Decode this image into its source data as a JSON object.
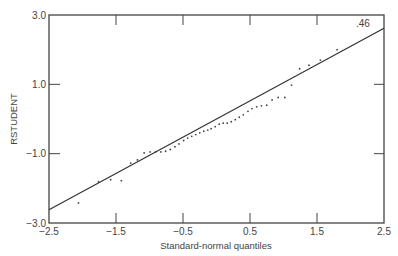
{
  "chart_data": {
    "type": "scatter",
    "title": "",
    "xlabel": "Standard-normal quantiles",
    "ylabel": "RSTUDENT",
    "xlim": [
      -2.5,
      2.5
    ],
    "ylim": [
      -3.0,
      3.0
    ],
    "x_ticks": [
      -2.5,
      -1.5,
      -0.5,
      0.5,
      1.5,
      2.5
    ],
    "x_tick_labels": [
      "−2.5",
      "−1.5",
      "−0.5",
      "0.5",
      "1.5",
      "2.5"
    ],
    "y_ticks": [
      3.0,
      1.0,
      -1.0,
      -3.0
    ],
    "y_tick_labels": [
      "3.0",
      "1.0",
      "−1.0",
      "−3.0"
    ],
    "grid": false,
    "annotation": ".46",
    "reference_line": {
      "x": [
        -2.5,
        2.5
      ],
      "y": [
        -2.62,
        2.62
      ]
    },
    "points": [
      {
        "x": -2.06,
        "y": -2.42
      },
      {
        "x": -1.76,
        "y": -1.81
      },
      {
        "x": -1.58,
        "y": -1.75
      },
      {
        "x": -1.42,
        "y": -1.78
      },
      {
        "x": -1.28,
        "y": -1.27
      },
      {
        "x": -1.18,
        "y": -1.18
      },
      {
        "x": -1.08,
        "y": -0.98
      },
      {
        "x": -0.99,
        "y": -0.95
      },
      {
        "x": -0.91,
        "y": -0.95
      },
      {
        "x": -0.83,
        "y": -0.95
      },
      {
        "x": -0.76,
        "y": -0.93
      },
      {
        "x": -0.69,
        "y": -0.88
      },
      {
        "x": -0.62,
        "y": -0.8
      },
      {
        "x": -0.56,
        "y": -0.72
      },
      {
        "x": -0.49,
        "y": -0.62
      },
      {
        "x": -0.43,
        "y": -0.55
      },
      {
        "x": -0.37,
        "y": -0.5
      },
      {
        "x": -0.31,
        "y": -0.45
      },
      {
        "x": -0.25,
        "y": -0.4
      },
      {
        "x": -0.19,
        "y": -0.35
      },
      {
        "x": -0.13,
        "y": -0.32
      },
      {
        "x": -0.08,
        "y": -0.28
      },
      {
        "x": -0.02,
        "y": -0.22
      },
      {
        "x": 0.04,
        "y": -0.15
      },
      {
        "x": 0.1,
        "y": -0.12
      },
      {
        "x": 0.16,
        "y": -0.12
      },
      {
        "x": 0.22,
        "y": -0.08
      },
      {
        "x": 0.28,
        "y": -0.02
      },
      {
        "x": 0.34,
        "y": 0.05
      },
      {
        "x": 0.4,
        "y": 0.12
      },
      {
        "x": 0.47,
        "y": 0.22
      },
      {
        "x": 0.53,
        "y": 0.3
      },
      {
        "x": 0.6,
        "y": 0.35
      },
      {
        "x": 0.67,
        "y": 0.38
      },
      {
        "x": 0.75,
        "y": 0.4
      },
      {
        "x": 0.83,
        "y": 0.55
      },
      {
        "x": 0.92,
        "y": 0.62
      },
      {
        "x": 1.02,
        "y": 0.62
      },
      {
        "x": 1.12,
        "y": 0.98
      },
      {
        "x": 1.24,
        "y": 1.45
      },
      {
        "x": 1.38,
        "y": 1.55
      },
      {
        "x": 1.55,
        "y": 1.7
      },
      {
        "x": 1.8,
        "y": 2.0
      }
    ]
  }
}
